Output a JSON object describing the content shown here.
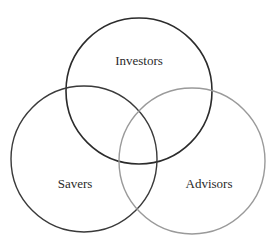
{
  "diagram": {
    "type": "venn",
    "sets": [
      {
        "label": "Investors",
        "cx": 139,
        "cy": 91,
        "r": 73,
        "stroke": "#2b2b2b",
        "stroke_width": 1.6,
        "label_x": 139,
        "label_y": 65
      },
      {
        "label": "Savers",
        "cx": 84,
        "cy": 159,
        "r": 73,
        "stroke": "#3a3a3a",
        "stroke_width": 1.4,
        "label_x": 75,
        "label_y": 188
      },
      {
        "label": "Advisors",
        "cx": 192,
        "cy": 161,
        "r": 73,
        "stroke": "#9a9a9a",
        "stroke_width": 1.4,
        "label_x": 209,
        "label_y": 188
      }
    ]
  }
}
